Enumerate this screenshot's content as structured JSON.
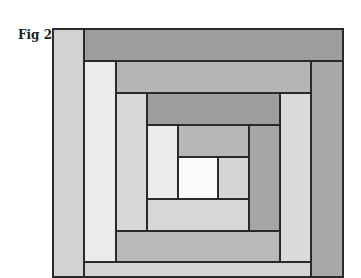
{
  "figure": {
    "label": "Fig 2"
  },
  "pieces": [
    {
      "name": "left-strip-1",
      "x": 52,
      "y": 28,
      "w": 33,
      "h": 250,
      "color": "#d2d2d2"
    },
    {
      "name": "top-strip-1",
      "x": 83,
      "y": 28,
      "w": 261,
      "h": 34,
      "color": "#9e9e9e"
    },
    {
      "name": "right-strip-1",
      "x": 310,
      "y": 60,
      "w": 34,
      "h": 218,
      "color": "#a9a9a9"
    },
    {
      "name": "left-strip-2",
      "x": 83,
      "y": 60,
      "w": 34,
      "h": 204,
      "color": "#ebebeb"
    },
    {
      "name": "top-strip-2",
      "x": 115,
      "y": 60,
      "w": 197,
      "h": 34,
      "color": "#b5b5b5"
    },
    {
      "name": "right-strip-2",
      "x": 279,
      "y": 92,
      "w": 33,
      "h": 172,
      "color": "#dadada"
    },
    {
      "name": "bottom-strip-1",
      "x": 83,
      "y": 261,
      "w": 229,
      "h": 17,
      "color": "#d4d4d4"
    },
    {
      "name": "left-strip-3",
      "x": 115,
      "y": 92,
      "w": 33,
      "h": 141,
      "color": "#d8d8d8"
    },
    {
      "name": "top-strip-3",
      "x": 146,
      "y": 92,
      "w": 135,
      "h": 34,
      "color": "#9d9d9d"
    },
    {
      "name": "right-strip-3",
      "x": 248,
      "y": 124,
      "w": 33,
      "h": 109,
      "color": "#a6a6a6"
    },
    {
      "name": "bottom-strip-2",
      "x": 115,
      "y": 230,
      "w": 166,
      "h": 33,
      "color": "#b9b9b9"
    },
    {
      "name": "left-strip-4",
      "x": 146,
      "y": 124,
      "w": 33,
      "h": 77,
      "color": "#ececec"
    },
    {
      "name": "top-strip-4",
      "x": 177,
      "y": 124,
      "w": 73,
      "h": 34,
      "color": "#b7b7b7"
    },
    {
      "name": "center-square",
      "x": 177,
      "y": 156,
      "w": 42,
      "h": 45,
      "color": "#fafafa"
    },
    {
      "name": "right-strip-4",
      "x": 217,
      "y": 156,
      "w": 33,
      "h": 45,
      "color": "#d5d5d5"
    },
    {
      "name": "bottom-strip-3",
      "x": 146,
      "y": 198,
      "w": 104,
      "h": 34,
      "color": "#d7d7d7"
    }
  ]
}
